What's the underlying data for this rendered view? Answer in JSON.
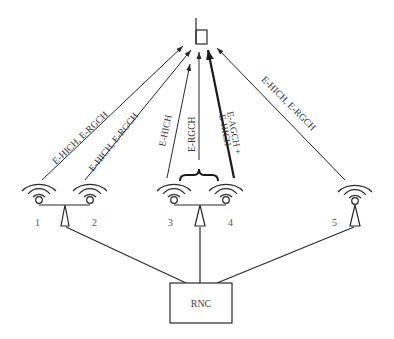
{
  "diagram": {
    "type": "network-diagram",
    "colors": {
      "stroke": "#2a2a2a",
      "text": "#333333",
      "background": "#ffffff"
    },
    "terminal": {
      "icon": "mobile-phone-icon"
    },
    "links": [
      {
        "from": "cell-1",
        "to": "terminal",
        "label": "E-HICH, E-RGCH",
        "style": "thin"
      },
      {
        "from": "cell-2",
        "to": "terminal",
        "label": "E-HICH, E-RGCH",
        "style": "thin"
      },
      {
        "from": "cell-3",
        "to": "terminal",
        "label": "E-HICH",
        "style": "thin"
      },
      {
        "from": "cell-3-4",
        "to": "terminal",
        "label": "E-RGCH",
        "style": "thin"
      },
      {
        "from": "cell-4",
        "to": "terminal",
        "label_line1": "E-AGCH +",
        "label_line2": "E-HICH",
        "style": "thick"
      },
      {
        "from": "cell-5",
        "to": "terminal",
        "label": "E-HICH, E-RGCH",
        "style": "thin"
      }
    ],
    "cells": [
      {
        "id": "cell-1",
        "label": "1"
      },
      {
        "id": "cell-2",
        "label": "2"
      },
      {
        "id": "cell-3",
        "label": "3"
      },
      {
        "id": "cell-4",
        "label": "4"
      },
      {
        "id": "cell-5",
        "label": "5"
      }
    ],
    "controller": {
      "label": "RNC"
    }
  }
}
